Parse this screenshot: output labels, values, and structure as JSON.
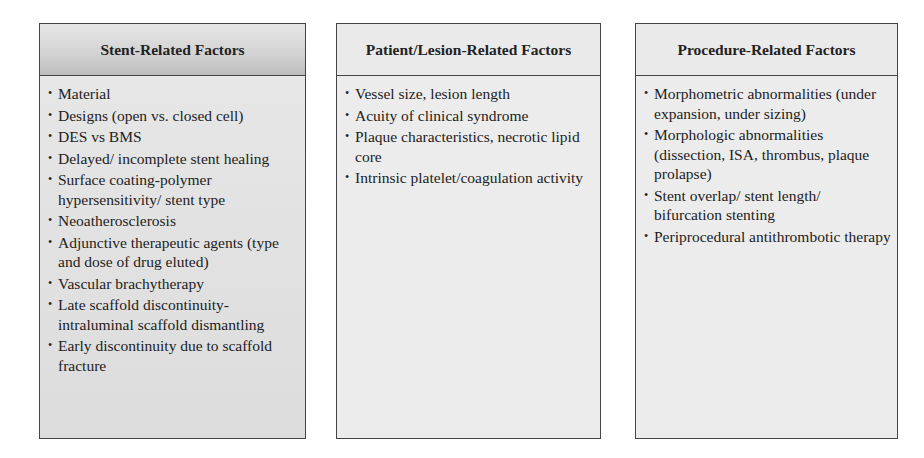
{
  "boxes": [
    {
      "title": "Stent-Related Factors",
      "items": [
        "Material",
        "Designs (open vs. closed cell)",
        "DES vs BMS",
        "Delayed/ incomplete stent healing",
        "Surface coating-polymer hypersensitivity/ stent type",
        "Neoatherosclerosis",
        "Adjunctive therapeutic agents (type and dose of drug eluted)",
        "Vascular brachytherapy",
        "Late scaffold discontinuity-intraluminal scaffold dismantling",
        "Early discontinuity due to scaffold fracture"
      ]
    },
    {
      "title": "Patient/Lesion-Related Factors",
      "items": [
        "Vessel size, lesion length",
        "Acuity of clinical syndrome",
        "Plaque characteristics, necrotic lipid core",
        "Intrinsic platelet/coagulation activity"
      ]
    },
    {
      "title": "Procedure-Related Factors",
      "items": [
        "Morphometric abnormalities (under expansion, under sizing)",
        "Morphologic abnormalities (dissection, ISA, thrombus, plaque prolapse)",
        "Stent overlap/ stent length/ bifurcation stenting",
        "Periprocedural antithrombotic therapy"
      ]
    }
  ]
}
